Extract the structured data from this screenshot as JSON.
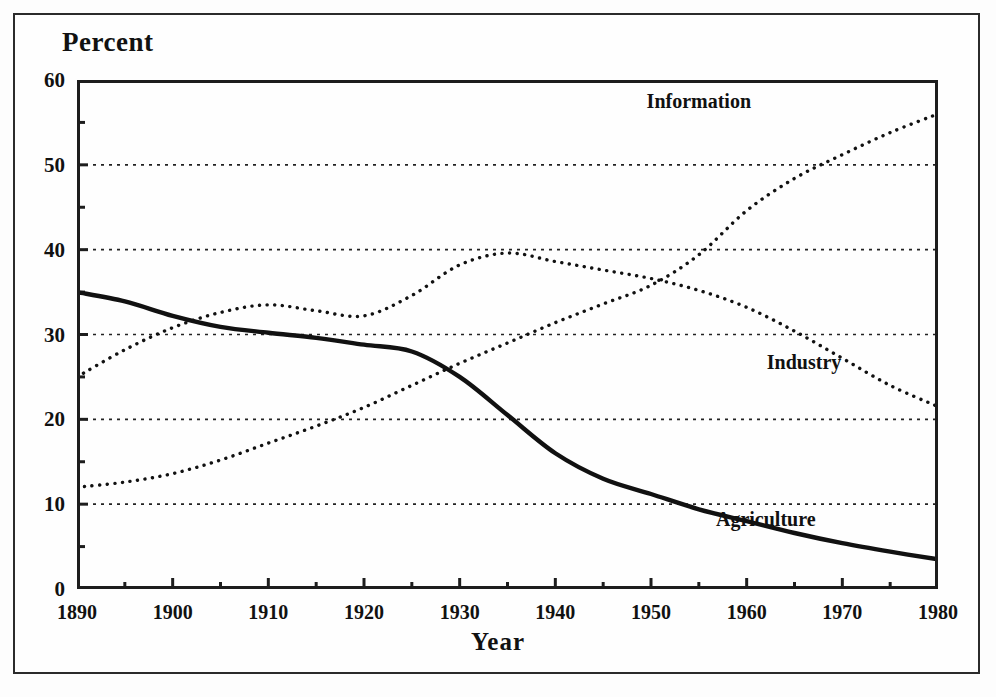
{
  "chart_data": {
    "type": "line",
    "title": "Percent",
    "xlabel": "Year",
    "ylabel": "Percent",
    "xlim": [
      1890,
      1980
    ],
    "ylim": [
      0,
      60
    ],
    "xticks": [
      1890,
      1900,
      1910,
      1920,
      1930,
      1940,
      1950,
      1960,
      1970,
      1980
    ],
    "yticks": [
      0,
      10,
      20,
      30,
      40,
      50,
      60
    ],
    "yticks_minor": [
      5,
      15,
      25,
      35,
      45,
      55
    ],
    "grid": "horizontal-dotted",
    "gridlines": [
      10,
      20,
      30,
      40,
      50
    ],
    "legend": "inline-labels",
    "x": [
      1890,
      1895,
      1900,
      1905,
      1910,
      1915,
      1920,
      1925,
      1930,
      1935,
      1940,
      1945,
      1950,
      1955,
      1960,
      1965,
      1970,
      1975,
      1980
    ],
    "series": [
      {
        "name": "Agriculture",
        "style": "solid",
        "label_x": 1962,
        "label_y": 8.2,
        "values": [
          35.0,
          33.9,
          32.2,
          30.9,
          30.2,
          29.6,
          28.8,
          28.0,
          25.0,
          20.5,
          16.0,
          13.0,
          11.2,
          9.4,
          8.0,
          6.6,
          5.4,
          4.4,
          3.5
        ]
      },
      {
        "name": "Industry",
        "style": "dotted",
        "label_x": 1966,
        "label_y": 26.8,
        "values": [
          25.0,
          28.2,
          30.8,
          32.6,
          33.5,
          32.8,
          32.2,
          34.6,
          38.2,
          39.6,
          38.6,
          37.6,
          36.6,
          35.2,
          33.2,
          30.4,
          27.2,
          24.0,
          21.5
        ]
      },
      {
        "name": "Information",
        "style": "dotted",
        "label_x": 1955,
        "label_y": 57.5,
        "values": [
          12.0,
          12.6,
          13.6,
          15.2,
          17.2,
          19.2,
          21.4,
          24.0,
          26.6,
          29.0,
          31.4,
          33.6,
          35.8,
          39.4,
          44.6,
          48.4,
          51.2,
          53.8,
          56.0
        ]
      }
    ]
  },
  "axis": {
    "y_labels": [
      "60",
      "50",
      "40",
      "30",
      "20",
      "10",
      "0"
    ],
    "x_labels": [
      "1890",
      "1900",
      "1910",
      "1920",
      "1930",
      "1940",
      "1950",
      "1960",
      "1970",
      "1980"
    ]
  },
  "labels": {
    "title": "Percent",
    "xaxis": "Year",
    "series_information": "Information",
    "series_industry": "Industry",
    "series_agriculture": "Agriculture"
  }
}
